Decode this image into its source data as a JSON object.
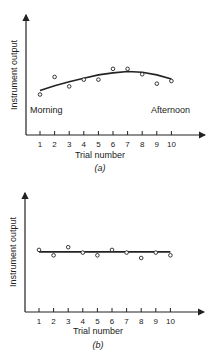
{
  "chart_data": [
    {
      "type": "scatter",
      "panel_label": "(a)",
      "xlabel": "Trial number",
      "ylabel": "Instrument output",
      "annotations": [
        "Morning",
        "Afternoon"
      ],
      "x": [
        1,
        2,
        3,
        4,
        5,
        6,
        7,
        8,
        9,
        10
      ],
      "points_y": [
        3.0,
        4.3,
        3.6,
        4.1,
        4.1,
        4.9,
        4.9,
        4.5,
        3.8,
        4.0
      ],
      "fit_curve_y": [
        3.3,
        3.65,
        3.95,
        4.2,
        4.45,
        4.6,
        4.7,
        4.65,
        4.45,
        4.15
      ],
      "fit": "smooth curve (rising then falling)",
      "grid": false,
      "ylim": [
        0,
        6.5
      ]
    },
    {
      "type": "scatter",
      "panel_label": "(b)",
      "xlabel": "Trial number",
      "ylabel": "Instrument output",
      "x": [
        1,
        2,
        3,
        4,
        5,
        6,
        7,
        8,
        9,
        10
      ],
      "points_y": [
        4.6,
        4.2,
        4.8,
        4.4,
        4.2,
        4.6,
        4.4,
        4.0,
        4.4,
        4.2
      ],
      "fit_line_y": [
        4.45,
        4.45,
        4.45,
        4.45,
        4.45,
        4.45,
        4.45,
        4.45,
        4.45,
        4.45
      ],
      "fit": "horizontal straight line",
      "grid": false,
      "ylim": [
        0,
        6.5
      ]
    }
  ],
  "panels": [
    {
      "label": "(a)",
      "xlabel": "Trial number",
      "ylabel": "Instrument output",
      "morning": "Morning",
      "afternoon": "Afternoon",
      "ticks": [
        "1",
        "2",
        "3",
        "4",
        "5",
        "6",
        "7",
        "8",
        "9",
        "10"
      ]
    },
    {
      "label": "(b)",
      "xlabel": "Trial number",
      "ylabel": "Instrument output",
      "ticks": [
        "1",
        "2",
        "3",
        "4",
        "5",
        "6",
        "7",
        "8",
        "9",
        "10"
      ]
    }
  ]
}
